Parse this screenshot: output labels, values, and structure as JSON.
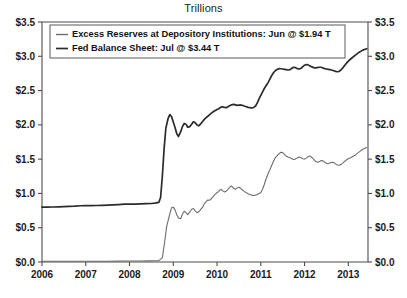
{
  "chart_data": {
    "type": "line",
    "title": "Trillions",
    "xlabel": "",
    "ylabel": "",
    "ylim": [
      0.0,
      3.5
    ],
    "xlim": [
      2006.0,
      2013.45
    ],
    "grid": false,
    "legend_position": "upper-left",
    "y_ticks": [
      0.0,
      0.5,
      1.0,
      1.5,
      2.0,
      2.5,
      3.0,
      3.5
    ],
    "y_tick_labels": [
      "$0.0",
      "$0.5",
      "$1.0",
      "$1.5",
      "$2.0",
      "$2.5",
      "$3.0",
      "$3.5"
    ],
    "y_ticks_right": [
      0.0,
      0.5,
      1.0,
      1.5,
      2.0,
      2.5,
      3.0,
      3.5
    ],
    "y_tick_labels_right": [
      "$0.0",
      "$0.5",
      "$1.0",
      "$1.5",
      "$2.0",
      "$2.5",
      "$3.0",
      "$3.5"
    ],
    "x_ticks": [
      2006,
      2007,
      2008,
      2009,
      2010,
      2011,
      2012,
      2013
    ],
    "x_tick_labels": [
      "2006",
      "2007",
      "2008",
      "2009",
      "2010",
      "2011",
      "2012",
      "2013"
    ],
    "series": [
      {
        "name": "Excess Reserves at Depository Institutions: Jun @ $1.94 T",
        "short_name": "Excess Reserves at Depository Institutions",
        "last_label": "Jun @ $1.94 T",
        "color": "#6e6e6e",
        "width": 1.1,
        "points": [
          [
            2006.0,
            0.01
          ],
          [
            2006.25,
            0.011
          ],
          [
            2006.5,
            0.012
          ],
          [
            2006.75,
            0.012
          ],
          [
            2007.0,
            0.012
          ],
          [
            2007.25,
            0.011
          ],
          [
            2007.5,
            0.012
          ],
          [
            2007.75,
            0.013
          ],
          [
            2008.0,
            0.014
          ],
          [
            2008.25,
            0.015
          ],
          [
            2008.42,
            0.016
          ],
          [
            2008.58,
            0.018
          ],
          [
            2008.67,
            0.02
          ],
          [
            2008.75,
            0.06
          ],
          [
            2008.8,
            0.28
          ],
          [
            2008.85,
            0.52
          ],
          [
            2008.92,
            0.7
          ],
          [
            2008.96,
            0.79
          ],
          [
            2009.0,
            0.8
          ],
          [
            2009.04,
            0.76
          ],
          [
            2009.08,
            0.69
          ],
          [
            2009.12,
            0.64
          ],
          [
            2009.17,
            0.63
          ],
          [
            2009.21,
            0.7
          ],
          [
            2009.25,
            0.74
          ],
          [
            2009.29,
            0.72
          ],
          [
            2009.33,
            0.69
          ],
          [
            2009.38,
            0.73
          ],
          [
            2009.42,
            0.77
          ],
          [
            2009.46,
            0.78
          ],
          [
            2009.5,
            0.745
          ],
          [
            2009.54,
            0.72
          ],
          [
            2009.58,
            0.73
          ],
          [
            2009.62,
            0.76
          ],
          [
            2009.67,
            0.8
          ],
          [
            2009.71,
            0.85
          ],
          [
            2009.75,
            0.88
          ],
          [
            2009.79,
            0.905
          ],
          [
            2009.83,
            0.9
          ],
          [
            2009.88,
            0.93
          ],
          [
            2009.92,
            0.96
          ],
          [
            2009.96,
            0.99
          ],
          [
            2010.0,
            1.01
          ],
          [
            2010.04,
            1.03
          ],
          [
            2010.08,
            1.06
          ],
          [
            2010.12,
            1.045
          ],
          [
            2010.17,
            1.02
          ],
          [
            2010.21,
            1.035
          ],
          [
            2010.25,
            1.06
          ],
          [
            2010.29,
            1.09
          ],
          [
            2010.33,
            1.11
          ],
          [
            2010.38,
            1.075
          ],
          [
            2010.42,
            1.06
          ],
          [
            2010.46,
            1.08
          ],
          [
            2010.5,
            1.09
          ],
          [
            2010.54,
            1.075
          ],
          [
            2010.58,
            1.05
          ],
          [
            2010.62,
            1.03
          ],
          [
            2010.67,
            1.01
          ],
          [
            2010.71,
            0.995
          ],
          [
            2010.75,
            0.985
          ],
          [
            2010.79,
            0.975
          ],
          [
            2010.83,
            0.97
          ],
          [
            2010.88,
            0.975
          ],
          [
            2010.92,
            0.985
          ],
          [
            2010.96,
            1.0
          ],
          [
            2011.0,
            1.01
          ],
          [
            2011.04,
            1.06
          ],
          [
            2011.08,
            1.13
          ],
          [
            2011.12,
            1.21
          ],
          [
            2011.17,
            1.29
          ],
          [
            2011.21,
            1.35
          ],
          [
            2011.25,
            1.41
          ],
          [
            2011.29,
            1.47
          ],
          [
            2011.33,
            1.52
          ],
          [
            2011.38,
            1.555
          ],
          [
            2011.42,
            1.58
          ],
          [
            2011.46,
            1.6
          ],
          [
            2011.5,
            1.595
          ],
          [
            2011.54,
            1.57
          ],
          [
            2011.58,
            1.545
          ],
          [
            2011.62,
            1.53
          ],
          [
            2011.67,
            1.52
          ],
          [
            2011.71,
            1.505
          ],
          [
            2011.75,
            1.495
          ],
          [
            2011.79,
            1.5
          ],
          [
            2011.83,
            1.515
          ],
          [
            2011.88,
            1.53
          ],
          [
            2011.92,
            1.52
          ],
          [
            2011.96,
            1.505
          ],
          [
            2012.0,
            1.5
          ],
          [
            2012.04,
            1.515
          ],
          [
            2012.08,
            1.535
          ],
          [
            2012.12,
            1.545
          ],
          [
            2012.17,
            1.525
          ],
          [
            2012.21,
            1.495
          ],
          [
            2012.25,
            1.47
          ],
          [
            2012.29,
            1.455
          ],
          [
            2012.33,
            1.46
          ],
          [
            2012.38,
            1.48
          ],
          [
            2012.42,
            1.475
          ],
          [
            2012.46,
            1.455
          ],
          [
            2012.5,
            1.44
          ],
          [
            2012.54,
            1.435
          ],
          [
            2012.58,
            1.445
          ],
          [
            2012.62,
            1.455
          ],
          [
            2012.67,
            1.45
          ],
          [
            2012.71,
            1.43
          ],
          [
            2012.75,
            1.415
          ],
          [
            2012.79,
            1.41
          ],
          [
            2012.83,
            1.42
          ],
          [
            2012.88,
            1.445
          ],
          [
            2012.92,
            1.47
          ],
          [
            2012.96,
            1.49
          ],
          [
            2013.0,
            1.505
          ],
          [
            2013.08,
            1.53
          ],
          [
            2013.17,
            1.565
          ],
          [
            2013.25,
            1.605
          ],
          [
            2013.33,
            1.645
          ],
          [
            2013.42,
            1.67
          ]
        ]
      },
      {
        "name": "Fed Balance Sheet: Jul @ $3.44 T",
        "short_name": "Fed Balance Sheet",
        "last_label": "Jul @ $3.44 T",
        "color": "#2b2b2b",
        "width": 1.7,
        "points": [
          [
            2006.0,
            0.8
          ],
          [
            2006.12,
            0.8
          ],
          [
            2006.25,
            0.802
          ],
          [
            2006.38,
            0.805
          ],
          [
            2006.5,
            0.808
          ],
          [
            2006.62,
            0.812
          ],
          [
            2006.75,
            0.815
          ],
          [
            2006.88,
            0.82
          ],
          [
            2007.0,
            0.822
          ],
          [
            2007.12,
            0.822
          ],
          [
            2007.25,
            0.824
          ],
          [
            2007.38,
            0.827
          ],
          [
            2007.5,
            0.83
          ],
          [
            2007.62,
            0.833
          ],
          [
            2007.75,
            0.838
          ],
          [
            2007.88,
            0.843
          ],
          [
            2008.0,
            0.845
          ],
          [
            2008.12,
            0.845
          ],
          [
            2008.25,
            0.848
          ],
          [
            2008.38,
            0.85
          ],
          [
            2008.5,
            0.853
          ],
          [
            2008.58,
            0.858
          ],
          [
            2008.67,
            0.87
          ],
          [
            2008.71,
            0.94
          ],
          [
            2008.75,
            1.25
          ],
          [
            2008.79,
            1.65
          ],
          [
            2008.83,
            1.95
          ],
          [
            2008.88,
            2.09
          ],
          [
            2008.92,
            2.15
          ],
          [
            2008.96,
            2.12
          ],
          [
            2009.0,
            2.04
          ],
          [
            2009.04,
            1.96
          ],
          [
            2009.08,
            1.87
          ],
          [
            2009.12,
            1.83
          ],
          [
            2009.17,
            1.9
          ],
          [
            2009.21,
            1.975
          ],
          [
            2009.25,
            2.02
          ],
          [
            2009.29,
            2.01
          ],
          [
            2009.33,
            1.965
          ],
          [
            2009.38,
            1.975
          ],
          [
            2009.42,
            2.01
          ],
          [
            2009.46,
            2.045
          ],
          [
            2009.5,
            2.03
          ],
          [
            2009.54,
            2.0
          ],
          [
            2009.58,
            1.985
          ],
          [
            2009.62,
            2.01
          ],
          [
            2009.67,
            2.05
          ],
          [
            2009.71,
            2.08
          ],
          [
            2009.75,
            2.105
          ],
          [
            2009.79,
            2.125
          ],
          [
            2009.83,
            2.15
          ],
          [
            2009.88,
            2.175
          ],
          [
            2009.92,
            2.195
          ],
          [
            2009.96,
            2.21
          ],
          [
            2010.0,
            2.225
          ],
          [
            2010.04,
            2.235
          ],
          [
            2010.08,
            2.255
          ],
          [
            2010.12,
            2.265
          ],
          [
            2010.17,
            2.255
          ],
          [
            2010.21,
            2.25
          ],
          [
            2010.25,
            2.265
          ],
          [
            2010.29,
            2.28
          ],
          [
            2010.33,
            2.292
          ],
          [
            2010.38,
            2.298
          ],
          [
            2010.42,
            2.292
          ],
          [
            2010.46,
            2.285
          ],
          [
            2010.5,
            2.288
          ],
          [
            2010.54,
            2.29
          ],
          [
            2010.58,
            2.285
          ],
          [
            2010.62,
            2.275
          ],
          [
            2010.67,
            2.265
          ],
          [
            2010.71,
            2.255
          ],
          [
            2010.75,
            2.25
          ],
          [
            2010.79,
            2.248
          ],
          [
            2010.83,
            2.252
          ],
          [
            2010.88,
            2.275
          ],
          [
            2010.92,
            2.32
          ],
          [
            2010.96,
            2.38
          ],
          [
            2011.0,
            2.43
          ],
          [
            2011.04,
            2.48
          ],
          [
            2011.08,
            2.53
          ],
          [
            2011.12,
            2.57
          ],
          [
            2011.17,
            2.62
          ],
          [
            2011.21,
            2.67
          ],
          [
            2011.25,
            2.72
          ],
          [
            2011.29,
            2.76
          ],
          [
            2011.33,
            2.79
          ],
          [
            2011.38,
            2.81
          ],
          [
            2011.42,
            2.82
          ],
          [
            2011.46,
            2.818
          ],
          [
            2011.5,
            2.815
          ],
          [
            2011.54,
            2.81
          ],
          [
            2011.58,
            2.805
          ],
          [
            2011.62,
            2.8
          ],
          [
            2011.67,
            2.805
          ],
          [
            2011.71,
            2.825
          ],
          [
            2011.75,
            2.84
          ],
          [
            2011.79,
            2.835
          ],
          [
            2011.83,
            2.82
          ],
          [
            2011.88,
            2.815
          ],
          [
            2011.92,
            2.825
          ],
          [
            2011.96,
            2.85
          ],
          [
            2012.0,
            2.87
          ],
          [
            2012.04,
            2.88
          ],
          [
            2012.08,
            2.875
          ],
          [
            2012.12,
            2.86
          ],
          [
            2012.17,
            2.845
          ],
          [
            2012.21,
            2.835
          ],
          [
            2012.25,
            2.83
          ],
          [
            2012.29,
            2.835
          ],
          [
            2012.33,
            2.84
          ],
          [
            2012.38,
            2.84
          ],
          [
            2012.42,
            2.83
          ],
          [
            2012.46,
            2.82
          ],
          [
            2012.5,
            2.815
          ],
          [
            2012.54,
            2.81
          ],
          [
            2012.58,
            2.805
          ],
          [
            2012.62,
            2.8
          ],
          [
            2012.67,
            2.79
          ],
          [
            2012.71,
            2.78
          ],
          [
            2012.75,
            2.775
          ],
          [
            2012.79,
            2.78
          ],
          [
            2012.83,
            2.8
          ],
          [
            2012.88,
            2.835
          ],
          [
            2012.92,
            2.87
          ],
          [
            2012.96,
            2.9
          ],
          [
            2013.0,
            2.93
          ],
          [
            2013.08,
            2.975
          ],
          [
            2013.17,
            3.02
          ],
          [
            2013.25,
            3.06
          ],
          [
            2013.33,
            3.09
          ],
          [
            2013.42,
            3.11
          ]
        ]
      }
    ]
  },
  "colors": {
    "background": "#ffffff",
    "axis": "#4d4d4d",
    "text": "#1b1b1b",
    "series_excess_reserves": "#6e6e6e",
    "series_fed_balance_sheet": "#2b2b2b",
    "legend_border": "#5a5a5a"
  }
}
